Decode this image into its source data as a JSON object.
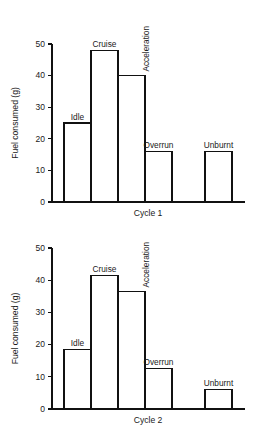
{
  "figure": {
    "background_color": "#ffffff",
    "line_color": "#111111",
    "bar_fill_color": "#ffffff",
    "text_color": "#1a1a1a"
  },
  "chart_data": [
    {
      "type": "bar",
      "title": "",
      "xlabel": "Cycle 1",
      "ylabel": "Fuel consumed (g)",
      "categories": [
        "Idle",
        "Cruise",
        "Acceleration",
        "Overrun",
        "Unburnt"
      ],
      "values": [
        25,
        48,
        40,
        16,
        16
      ],
      "ylim": [
        0,
        50
      ],
      "yticks": [
        0,
        10,
        20,
        30,
        40,
        50
      ],
      "ytick_labels": [
        "0",
        "10",
        "20",
        "30",
        "40",
        "50"
      ],
      "grid": false,
      "legend": "none",
      "label_rotation": [
        "0",
        "0",
        "90",
        "0",
        "0"
      ],
      "bar_gap_before": [
        false,
        false,
        false,
        false,
        true
      ]
    },
    {
      "type": "bar",
      "title": "",
      "xlabel": "Cycle 2",
      "ylabel": "Fuel consumed (g)",
      "categories": [
        "Idle",
        "Cruise",
        "Acceleration",
        "Overrun",
        "Unburnt"
      ],
      "values": [
        18.5,
        41.5,
        36.5,
        12.5,
        6
      ],
      "ylim": [
        0,
        50
      ],
      "yticks": [
        0,
        10,
        20,
        30,
        40,
        50
      ],
      "ytick_labels": [
        "0",
        "10",
        "20",
        "30",
        "40",
        "50"
      ],
      "grid": false,
      "legend": "none",
      "label_rotation": [
        "0",
        "0",
        "90",
        "0",
        "0"
      ],
      "bar_gap_before": [
        false,
        false,
        false,
        false,
        true
      ]
    }
  ]
}
